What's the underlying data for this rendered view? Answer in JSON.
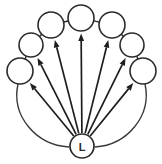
{
  "diagram": {
    "background_color": "#ffffff",
    "stroke_color": "#2b2b2b",
    "arrow_color": "#1e1e1e",
    "canvas": {
      "width": 162,
      "height": 164
    },
    "hub": {
      "label": "L",
      "name": "hub-node-l",
      "cx": 82,
      "cy": 146,
      "r": 12
    },
    "ring_nodes": [
      {
        "label": "",
        "name": "ring-node-1",
        "cx": 20,
        "cy": 71,
        "r": 13
      },
      {
        "label": "",
        "name": "ring-node-2",
        "cx": 31,
        "cy": 45,
        "r": 12
      },
      {
        "label": "",
        "name": "ring-node-3",
        "cx": 51,
        "cy": 25,
        "r": 13
      },
      {
        "label": "",
        "name": "ring-node-4",
        "cx": 81,
        "cy": 18,
        "r": 13
      },
      {
        "label": "",
        "name": "ring-node-5",
        "cx": 112,
        "cy": 25,
        "r": 13
      },
      {
        "label": "",
        "name": "ring-node-6",
        "cx": 132,
        "cy": 45,
        "r": 12
      },
      {
        "label": "",
        "name": "ring-node-7",
        "cx": 143,
        "cy": 71,
        "r": 13
      }
    ],
    "ring_links": [
      {
        "name": "ring-link-1-2",
        "from": 0,
        "to": 1
      },
      {
        "name": "ring-link-2-3",
        "from": 1,
        "to": 2
      },
      {
        "name": "ring-link-3-4",
        "from": 2,
        "to": 3
      },
      {
        "name": "ring-link-4-5",
        "from": 3,
        "to": 4
      },
      {
        "name": "ring-link-5-6",
        "from": 4,
        "to": 5
      },
      {
        "name": "ring-link-6-7",
        "from": 5,
        "to": 6
      }
    ],
    "spokes": [
      {
        "name": "spoke-arrow-to-node-1",
        "target": 0
      },
      {
        "name": "spoke-arrow-to-node-2",
        "target": 1
      },
      {
        "name": "spoke-arrow-to-node-3",
        "target": 2
      },
      {
        "name": "spoke-arrow-to-node-4",
        "target": 3
      },
      {
        "name": "spoke-arrow-to-node-5",
        "target": 4
      },
      {
        "name": "spoke-arrow-to-node-6",
        "target": 5
      },
      {
        "name": "spoke-arrow-to-node-7",
        "target": 6
      }
    ],
    "outer_arcs": [
      {
        "name": "outer-arc-left",
        "path": "M 18 84 C 11 116 36 145 69 147"
      },
      {
        "name": "outer-arc-right",
        "path": "M 145 84 C 152 116 127 145 95 147"
      }
    ]
  }
}
